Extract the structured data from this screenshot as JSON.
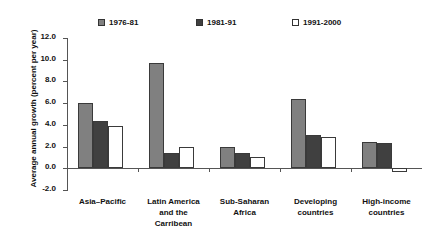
{
  "chart_data": {
    "type": "bar",
    "title": "",
    "subtitle": "",
    "xlabel": "",
    "ylabel": "Average annual growth (percent per year)",
    "categories": [
      "Asia–Pacific",
      "Latin America\nand the\nCarribean",
      "Sub-Saharan\nAfrica",
      "Developing\ncountries",
      "High-income\ncountries"
    ],
    "series": [
      {
        "name": "1976-81",
        "color": "#808080",
        "values": [
          6.0,
          9.7,
          2.0,
          6.4,
          2.4
        ]
      },
      {
        "name": "1981-91",
        "color": "#404040",
        "values": [
          4.4,
          1.4,
          1.4,
          3.1,
          2.3
        ]
      },
      {
        "name": "1991-2000",
        "color": "#ffffff",
        "values": [
          3.9,
          2.0,
          1.0,
          2.9,
          -0.3
        ]
      }
    ],
    "ylim": [
      -2.0,
      12.0
    ],
    "yticks": [
      12.0,
      10.0,
      8.0,
      6.0,
      4.0,
      2.0,
      0.0,
      -2.0
    ],
    "ytick_labels": [
      "12.0",
      "10.0",
      "8.0",
      "6.0",
      "4.0",
      "2.0",
      "0.0",
      "-2.0"
    ],
    "grid": false,
    "legend_position": "top",
    "zero_line": true
  },
  "legend": {
    "items": [
      {
        "label": "1976-81",
        "color": "#808080"
      },
      {
        "label": "1981-91",
        "color": "#404040"
      },
      {
        "label": "1991-2000",
        "color": "#ffffff"
      }
    ]
  }
}
